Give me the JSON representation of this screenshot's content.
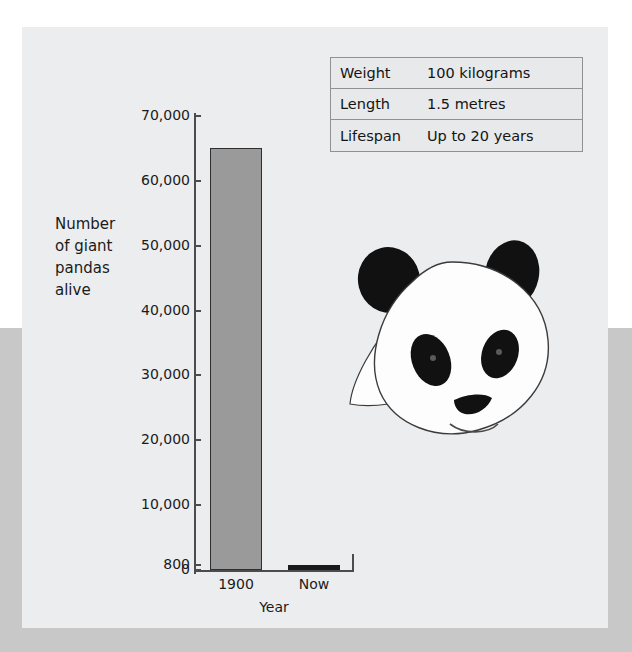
{
  "colors": {
    "outer_top_bg": "#ffffff",
    "outer_bottom_bg": "#c8c8c8",
    "panel_bg": "#ecedee",
    "axis": "#4c4c4c",
    "text": "#1b1b1b",
    "bar_1900": "#9a9a9a",
    "bar_now": "#1a1a1a",
    "table_border": "#8e9295",
    "panda_black": "#111111",
    "panda_white": "#fdfdfd"
  },
  "fact_table": {
    "rows": [
      {
        "label": "Weight",
        "value": "100 kilograms"
      },
      {
        "label": "Length",
        "value": "1.5 metres"
      },
      {
        "label": "Lifespan",
        "value": "Up to 20 years"
      }
    ]
  },
  "chart_data": {
    "type": "bar",
    "title": "",
    "subtitle": "",
    "categories": [
      "1900",
      "Now"
    ],
    "values": [
      65000,
      800
    ],
    "series": [
      {
        "name": "Number of giant pandas alive",
        "values": [
          65000,
          800
        ]
      }
    ],
    "xlabel": "Year",
    "ylabel": "Number of giant pandas alive",
    "ylabel_lines": [
      "Number",
      "of giant",
      "pandas",
      "alive"
    ],
    "ylim": [
      0,
      70000
    ],
    "ytick_values": [
      0,
      800,
      10000,
      20000,
      30000,
      40000,
      50000,
      60000,
      70000
    ],
    "ytick_labels": [
      "0",
      "800",
      "10,000",
      "20,000",
      "30,000",
      "40,000",
      "50,000",
      "60,000",
      "70,000"
    ],
    "bar_colors": [
      "#9a9a9a",
      "#1a1a1a"
    ],
    "grid": false,
    "legend": "none"
  },
  "illustration": {
    "name": "giant-panda-head",
    "alt": "Illustration of a giant panda head"
  }
}
